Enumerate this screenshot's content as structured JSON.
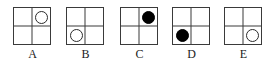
{
  "figure": {
    "colors": {
      "background": "#ffffff",
      "grid_line": "#3a3a3a",
      "circle_outline": "#2b2b2b",
      "circle_fill": "#000000",
      "label_text": "#1a1a1a"
    },
    "grid": {
      "rows": 2,
      "cols": 2,
      "cells": [
        "tl",
        "tr",
        "bl",
        "br"
      ]
    },
    "options": [
      {
        "label": "A",
        "x": 6,
        "shape": "circle",
        "fill": "open",
        "cell": "tr",
        "description": "open circle in top-right cell"
      },
      {
        "label": "B",
        "x": 59,
        "shape": "circle",
        "fill": "open",
        "cell": "bl",
        "description": "open circle in bottom-left cell"
      },
      {
        "label": "C",
        "x": 113,
        "shape": "circle",
        "fill": "filled",
        "cell": "tr",
        "description": "filled circle in top-right cell"
      },
      {
        "label": "D",
        "x": 165,
        "shape": "circle",
        "fill": "filled",
        "cell": "bl",
        "description": "filled circle in bottom-left cell"
      },
      {
        "label": "E",
        "x": 217,
        "shape": "circle",
        "fill": "open",
        "cell": "br",
        "description": "open circle in bottom-right cell"
      }
    ]
  }
}
